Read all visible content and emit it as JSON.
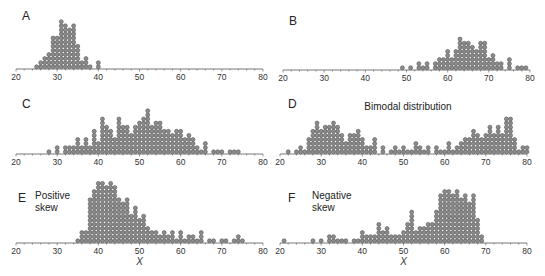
{
  "chart_data": [
    {
      "type": "scatter",
      "subtype": "dot-plot",
      "panel": "A",
      "title": "",
      "annotation": [],
      "xlabel": "",
      "xlim": [
        20,
        80
      ],
      "xticks": [
        20,
        30,
        40,
        50,
        60,
        70,
        80
      ],
      "counts": {
        "25": 1,
        "26": 2,
        "27": 3,
        "28": 4,
        "29": 8,
        "30": 8,
        "31": 12,
        "32": 11,
        "33": 10,
        "34": 11,
        "35": 6,
        "36": 2,
        "37": 3,
        "38": 1,
        "40": 2
      }
    },
    {
      "type": "scatter",
      "subtype": "dot-plot",
      "panel": "B",
      "title": "",
      "annotation": [],
      "xlabel": "",
      "xlim": [
        20,
        80
      ],
      "xticks": [
        20,
        30,
        40,
        50,
        60,
        70,
        80
      ],
      "counts": {
        "49": 1,
        "51": 1,
        "53": 2,
        "54": 1,
        "55": 2,
        "57": 2,
        "58": 3,
        "59": 3,
        "60": 5,
        "61": 3,
        "62": 5,
        "63": 8,
        "64": 7,
        "65": 7,
        "66": 6,
        "67": 5,
        "68": 7,
        "69": 7,
        "70": 3,
        "71": 4,
        "72": 2,
        "73": 2,
        "75": 3,
        "77": 1,
        "78": 1,
        "79": 1
      }
    },
    {
      "type": "scatter",
      "subtype": "dot-plot",
      "panel": "C",
      "title": "",
      "annotation": [],
      "xlabel": "",
      "xlim": [
        20,
        80
      ],
      "xticks": [
        20,
        30,
        40,
        50,
        60,
        70,
        80
      ],
      "counts": {
        "28": 1,
        "30": 2,
        "32": 2,
        "33": 2,
        "34": 2,
        "35": 4,
        "36": 2,
        "37": 4,
        "38": 2,
        "39": 6,
        "40": 3,
        "41": 9,
        "42": 7,
        "43": 6,
        "44": 4,
        "45": 9,
        "46": 7,
        "47": 7,
        "48": 5,
        "49": 7,
        "50": 8,
        "51": 9,
        "52": 11,
        "53": 7,
        "54": 8,
        "55": 8,
        "56": 6,
        "57": 6,
        "58": 5,
        "59": 6,
        "60": 6,
        "61": 4,
        "62": 5,
        "63": 4,
        "64": 2,
        "65": 1,
        "66": 3,
        "68": 1,
        "69": 1,
        "70": 1,
        "72": 1,
        "73": 1,
        "74": 1
      }
    },
    {
      "type": "scatter",
      "subtype": "dot-plot",
      "panel": "D",
      "title": "Bimodal distribution",
      "annotation": [],
      "xlabel": "",
      "xlim": [
        20,
        80
      ],
      "xticks": [
        20,
        30,
        40,
        50,
        60,
        70,
        80
      ],
      "counts": {
        "22": 1,
        "24": 1,
        "25": 2,
        "26": 1,
        "27": 4,
        "28": 6,
        "29": 8,
        "30": 6,
        "31": 7,
        "32": 7,
        "33": 8,
        "34": 7,
        "35": 5,
        "36": 3,
        "37": 5,
        "38": 5,
        "39": 6,
        "40": 4,
        "41": 2,
        "42": 2,
        "43": 4,
        "45": 2,
        "47": 1,
        "48": 2,
        "49": 1,
        "50": 2,
        "51": 1,
        "52": 1,
        "53": 3,
        "54": 2,
        "55": 1,
        "56": 2,
        "58": 2,
        "59": 1,
        "60": 1,
        "61": 3,
        "62": 1,
        "63": 2,
        "64": 3,
        "65": 4,
        "66": 4,
        "67": 6,
        "68": 5,
        "69": 4,
        "70": 5,
        "71": 7,
        "72": 5,
        "73": 7,
        "74": 5,
        "75": 9,
        "76": 9,
        "77": 4,
        "78": 1,
        "79": 2,
        "80": 2
      }
    },
    {
      "type": "scatter",
      "subtype": "dot-plot",
      "panel": "E",
      "title": "",
      "annotation": [
        "Positive",
        "skew"
      ],
      "xlabel": "X",
      "xlim": [
        20,
        80
      ],
      "xticks": [
        20,
        30,
        40,
        50,
        60,
        70,
        80
      ],
      "counts": {
        "35": 1,
        "36": 3,
        "37": 3,
        "38": 11,
        "39": 13,
        "40": 15,
        "41": 15,
        "42": 14,
        "43": 15,
        "44": 14,
        "45": 11,
        "46": 10,
        "47": 11,
        "48": 7,
        "49": 9,
        "50": 6,
        "51": 7,
        "52": 4,
        "53": 3,
        "54": 3,
        "55": 2,
        "56": 3,
        "57": 2,
        "58": 3,
        "59": 1,
        "60": 3,
        "61": 1,
        "62": 2,
        "63": 2,
        "64": 1,
        "65": 3,
        "67": 1,
        "68": 1,
        "70": 1,
        "71": 1,
        "73": 1,
        "74": 2,
        "75": 1
      }
    },
    {
      "type": "scatter",
      "subtype": "dot-plot",
      "panel": "F",
      "title": "",
      "annotation": [
        "Negative",
        "skew"
      ],
      "xlabel": "X",
      "xlim": [
        20,
        80
      ],
      "xticks": [
        20,
        30,
        40,
        50,
        60,
        70,
        80
      ],
      "counts": {
        "21": 1,
        "28": 1,
        "30": 1,
        "32": 2,
        "33": 2,
        "34": 1,
        "35": 1,
        "36": 1,
        "38": 1,
        "39": 1,
        "40": 3,
        "41": 2,
        "42": 2,
        "43": 2,
        "44": 5,
        "45": 3,
        "46": 4,
        "47": 2,
        "48": 2,
        "49": 2,
        "50": 3,
        "51": 5,
        "52": 8,
        "53": 3,
        "54": 4,
        "55": 4,
        "56": 5,
        "57": 5,
        "58": 8,
        "59": 12,
        "60": 13,
        "61": 13,
        "62": 12,
        "63": 13,
        "64": 11,
        "65": 12,
        "66": 10,
        "67": 12,
        "68": 6,
        "69": 2
      }
    }
  ]
}
